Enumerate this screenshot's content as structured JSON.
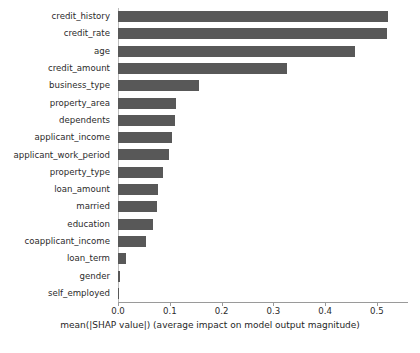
{
  "chart_data": {
    "type": "bar",
    "orientation": "horizontal",
    "title": "",
    "xlabel": "mean(|SHAP value|) (average impact on model output magnitude)",
    "ylabel": "",
    "xlim": [
      0.0,
      0.56
    ],
    "xticks": [
      0.0,
      0.1,
      0.2,
      0.3,
      0.4,
      0.5
    ],
    "xtick_labels": [
      "0.0",
      "0.1",
      "0.2",
      "0.3",
      "0.4",
      "0.5"
    ],
    "grid": false,
    "legend": null,
    "bar_color": "#585858",
    "categories": [
      "credit_history",
      "credit_rate",
      "age",
      "credit_amount",
      "business_type",
      "property_area",
      "dependents",
      "applicant_income",
      "applicant_work_period",
      "property_type",
      "loan_amount",
      "married",
      "education",
      "coapplicant_income",
      "loan_term",
      "gender",
      "self_employed"
    ],
    "values": [
      0.521,
      0.519,
      0.458,
      0.326,
      0.156,
      0.112,
      0.11,
      0.104,
      0.098,
      0.087,
      0.077,
      0.076,
      0.067,
      0.054,
      0.015,
      0.004,
      0.001
    ]
  },
  "caption": ""
}
